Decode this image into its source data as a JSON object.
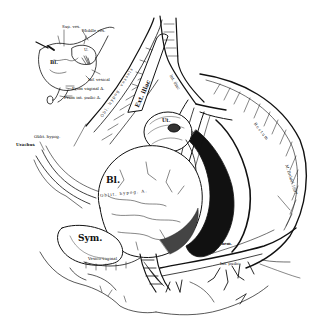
{
  "figure": {
    "background": "#ffffff",
    "ink": "#111111",
    "style": "engraving line art"
  },
  "inset": {
    "labels": {
      "sup_ves": "Sup. ves.",
      "middle_ves": "Middle ves.",
      "bl": "Bl.",
      "u": "U.",
      "inf_vesical": "Inf. vesical",
      "from_vaginal": "From vaginal A.",
      "from_int_pudic": "From int. pudic A."
    }
  },
  "main": {
    "labels": {
      "ext_iliac": "Ext. iliac",
      "int_iliac": "Int. iliac",
      "obl_hypog_vessels": "Obl. hypog. vessels",
      "ut": "Ut.",
      "rectum": "Rectum",
      "obl_hypog": "Oblit. hypog.",
      "urachus": "Urachus",
      "bl": "Bl.",
      "oblit_hypog_a": "Oblit. hypog. A.",
      "sym": "Sym.",
      "vesico_vaginal": "Vesico-vaginal",
      "inf_hem": "Inf. hem.",
      "int_pudic": "Int. pudic",
      "artist_sig": "M. Brödel 1897"
    }
  }
}
